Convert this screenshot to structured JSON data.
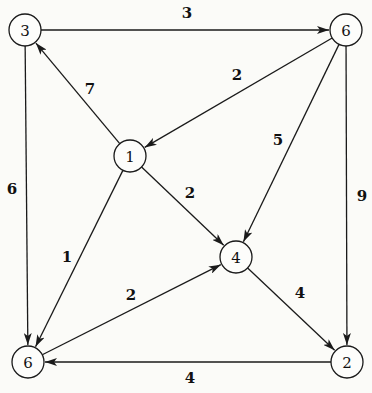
{
  "diagram": {
    "type": "weighted directed graph",
    "nodes": [
      {
        "id": "n3",
        "label": "3",
        "x": 25,
        "y": 30
      },
      {
        "id": "n6top",
        "label": "6",
        "x": 346,
        "y": 30
      },
      {
        "id": "n1",
        "label": "1",
        "x": 130,
        "y": 156
      },
      {
        "id": "n4",
        "label": "4",
        "x": 236,
        "y": 257
      },
      {
        "id": "n6bot",
        "label": "6",
        "x": 28,
        "y": 362
      },
      {
        "id": "n2",
        "label": "2",
        "x": 347,
        "y": 362
      }
    ],
    "edges": [
      {
        "from": "n3",
        "to": "n6top",
        "weight": "3",
        "lx": 187,
        "ly": 13
      },
      {
        "from": "n1",
        "to": "n3",
        "weight": "7",
        "lx": 90,
        "ly": 89
      },
      {
        "from": "n6top",
        "to": "n1",
        "weight": "2",
        "lx": 237,
        "ly": 75
      },
      {
        "from": "n6top",
        "to": "n4",
        "weight": "5",
        "lx": 278,
        "ly": 140
      },
      {
        "from": "n6top",
        "to": "n2",
        "weight": "9",
        "lx": 362,
        "ly": 196
      },
      {
        "from": "n3",
        "to": "n6bot",
        "weight": "6",
        "lx": 12,
        "ly": 189
      },
      {
        "from": "n1",
        "to": "n4",
        "weight": "2",
        "lx": 190,
        "ly": 193
      },
      {
        "from": "n1",
        "to": "n6bot",
        "weight": "1",
        "lx": 67,
        "ly": 257
      },
      {
        "from": "n6bot",
        "to": "n4",
        "weight": "2",
        "lx": 131,
        "ly": 295
      },
      {
        "from": "n4",
        "to": "n2",
        "weight": "4",
        "lx": 300,
        "ly": 293
      },
      {
        "from": "n2",
        "to": "n6bot",
        "weight": "4",
        "lx": 190,
        "ly": 378
      }
    ]
  }
}
